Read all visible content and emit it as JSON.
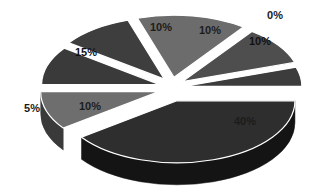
{
  "chart_data": {
    "type": "pie",
    "title": "",
    "subtitle": "",
    "xlabel": "",
    "ylabel": "",
    "legend": "none",
    "grid": false,
    "background_color": "#ffffff",
    "style": "3d-exploded-grayscale",
    "label_format": "percent",
    "categories": [
      "Slice 1",
      "Slice 2",
      "Slice 3",
      "Slice 4",
      "Slice 5",
      "Slice 6",
      "Slice 7",
      "Slice 8"
    ],
    "values": [
      40,
      10,
      0,
      10,
      10,
      15,
      10,
      5
    ],
    "labels": [
      "40%",
      "10%",
      "0%",
      "10%",
      "10%",
      "15%",
      "10%",
      "5%"
    ],
    "total": 100,
    "slices": [
      {
        "label": "40%",
        "value": 40,
        "start_angle": 0,
        "end_angle": 144,
        "top_color": "#2e2e2e",
        "side_color": "#141414",
        "exploded": true,
        "explode_distance": 16,
        "label_x": 245,
        "label_y": 125,
        "label_class": "label-on-dark"
      },
      {
        "label": "10%",
        "value": 10,
        "start_angle": 144,
        "end_angle": 180,
        "top_color": "#6e6e6e",
        "side_color": "#3a3a3a",
        "exploded": true,
        "explode_distance": 14,
        "label_x": 260,
        "label_y": 45,
        "label_class": "label-on-light"
      },
      {
        "label": "0%",
        "value": 0,
        "start_angle": 180,
        "end_angle": 180,
        "top_color": "#8a8a8a",
        "side_color": "#4a4a4a",
        "exploded": true,
        "explode_distance": 10,
        "label_x": 275,
        "label_y": 19,
        "label_class": "label-outside"
      },
      {
        "label": "10%",
        "value": 10,
        "start_angle": 180,
        "end_angle": 216,
        "top_color": "#3a3a3a",
        "side_color": "#1d1d1d",
        "exploded": true,
        "explode_distance": 13,
        "label_x": 210,
        "label_y": 34,
        "label_class": "label-on-dark"
      },
      {
        "label": "10%",
        "value": 10,
        "start_angle": 216,
        "end_angle": 252,
        "top_color": "#3e3e3e",
        "side_color": "#1f1f1f",
        "exploded": true,
        "explode_distance": 13,
        "label_x": 161,
        "label_y": 31,
        "label_class": "label-on-dark"
      },
      {
        "label": "15%",
        "value": 15,
        "start_angle": 252,
        "end_angle": 306,
        "top_color": "#6c6c6c",
        "side_color": "#323232",
        "exploded": true,
        "explode_distance": 13,
        "label_x": 86,
        "label_y": 56,
        "label_class": "label-on-light"
      },
      {
        "label": "10%",
        "value": 10,
        "start_angle": 306,
        "end_angle": 342,
        "top_color": "#4e4e4e",
        "side_color": "#252525",
        "exploded": true,
        "explode_distance": 13,
        "label_x": 90,
        "label_y": 110,
        "label_class": "label-on-dark"
      },
      {
        "label": "5%",
        "value": 5,
        "start_angle": 342,
        "end_angle": 360,
        "top_color": "#3c3c3c",
        "side_color": "#1e1e1e",
        "exploded": true,
        "explode_distance": 12,
        "label_x": 32,
        "label_y": 112,
        "label_class": "label-outside"
      }
    ],
    "geometry": {
      "center_x": 172,
      "center_y": 88,
      "radius_x": 118,
      "radius_y": 62,
      "depth": 22,
      "rotation_deg": 0
    }
  }
}
